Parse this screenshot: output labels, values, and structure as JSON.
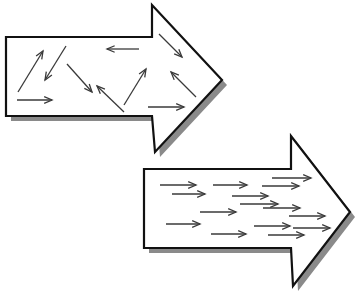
{
  "figure": {
    "width": 360,
    "height": 300,
    "background_color": "#ffffff",
    "outline_color": "#111111",
    "shadow_color": "#8a8a8a",
    "interior_arrow_color": "#3a3a3a",
    "outline_width": 2.2,
    "interior_arrow_width": 1.3
  },
  "shapes": [
    {
      "name": "disordered-arrow",
      "label": "upper-left block arrow with randomly oriented interior arrows",
      "direction": "right",
      "fill": "#ffffff",
      "outline_points": "6,37 152,37 152,5 222,80 155,152 152,116 6,116",
      "shadow_offset_x": 5,
      "shadow_offset_y": 5,
      "interior_arrows": [
        {
          "name": "arrow-up-right-1",
          "x1": 18,
          "y1": 92,
          "x2": 43,
          "y2": 51,
          "angle_deg": -58
        },
        {
          "name": "arrow-down-left-1",
          "x1": 66,
          "y1": 46,
          "x2": 45,
          "y2": 80,
          "angle_deg": 122
        },
        {
          "name": "arrow-right-1",
          "x1": 17,
          "y1": 100,
          "x2": 52,
          "y2": 100,
          "angle_deg": 0
        },
        {
          "name": "arrow-down-right-1",
          "x1": 67,
          "y1": 64,
          "x2": 92,
          "y2": 92,
          "angle_deg": 48
        },
        {
          "name": "arrow-left-1",
          "x1": 139,
          "y1": 49,
          "x2": 107,
          "y2": 49,
          "angle_deg": 180
        },
        {
          "name": "arrow-up-left-1",
          "x1": 124,
          "y1": 112,
          "x2": 97,
          "y2": 86,
          "angle_deg": -136
        },
        {
          "name": "arrow-up-right-2",
          "x1": 124,
          "y1": 105,
          "x2": 146,
          "y2": 69,
          "angle_deg": -59
        },
        {
          "name": "arrow-down-right-2",
          "x1": 159,
          "y1": 34,
          "x2": 182,
          "y2": 57,
          "angle_deg": 45
        },
        {
          "name": "arrow-up-left-2",
          "x1": 196,
          "y1": 97,
          "x2": 171,
          "y2": 72,
          "angle_deg": -135
        },
        {
          "name": "arrow-right-2",
          "x1": 148,
          "y1": 107,
          "x2": 184,
          "y2": 107,
          "angle_deg": 0
        }
      ]
    },
    {
      "name": "ordered-arrow",
      "label": "lower-right block arrow with aligned rightward interior arrows",
      "direction": "right",
      "fill": "#ffffff",
      "outline_points": "144,169 291,169 291,136 350,212 293,286 291,248 144,248",
      "shadow_offset_x": 5,
      "shadow_offset_y": 5,
      "interior_arrows": [
        {
          "name": "arrow-right-r1-1",
          "x1": 160,
          "y1": 185,
          "x2": 196,
          "y2": 185,
          "angle_deg": 0
        },
        {
          "name": "arrow-right-r1-2",
          "x1": 213,
          "y1": 185,
          "x2": 247,
          "y2": 185,
          "angle_deg": 0
        },
        {
          "name": "arrow-right-r1-3",
          "x1": 262,
          "y1": 186,
          "x2": 299,
          "y2": 186,
          "angle_deg": 0
        },
        {
          "name": "arrow-right-r1-4",
          "x1": 272,
          "y1": 178,
          "x2": 311,
          "y2": 178,
          "angle_deg": 0
        },
        {
          "name": "arrow-right-r2-1",
          "x1": 172,
          "y1": 194,
          "x2": 205,
          "y2": 194,
          "angle_deg": 0
        },
        {
          "name": "arrow-right-r2-2",
          "x1": 232,
          "y1": 196,
          "x2": 268,
          "y2": 196,
          "angle_deg": 0
        },
        {
          "name": "arrow-right-r2-3",
          "x1": 240,
          "y1": 204,
          "x2": 278,
          "y2": 204,
          "angle_deg": 0
        },
        {
          "name": "arrow-right-r2-4",
          "x1": 263,
          "y1": 208,
          "x2": 300,
          "y2": 208,
          "angle_deg": 0
        },
        {
          "name": "arrow-right-r3-1",
          "x1": 200,
          "y1": 212,
          "x2": 236,
          "y2": 212,
          "angle_deg": 0
        },
        {
          "name": "arrow-right-r3-2",
          "x1": 289,
          "y1": 216,
          "x2": 325,
          "y2": 216,
          "angle_deg": 0
        },
        {
          "name": "arrow-right-r4-1",
          "x1": 166,
          "y1": 224,
          "x2": 200,
          "y2": 224,
          "angle_deg": 0
        },
        {
          "name": "arrow-right-r4-2",
          "x1": 254,
          "y1": 226,
          "x2": 290,
          "y2": 226,
          "angle_deg": 0
        },
        {
          "name": "arrow-right-r4-3",
          "x1": 293,
          "y1": 228,
          "x2": 330,
          "y2": 228,
          "angle_deg": 0
        },
        {
          "name": "arrow-right-r5-1",
          "x1": 211,
          "y1": 234,
          "x2": 246,
          "y2": 234,
          "angle_deg": 0
        },
        {
          "name": "arrow-right-r5-2",
          "x1": 268,
          "y1": 235,
          "x2": 304,
          "y2": 235,
          "angle_deg": 0
        }
      ]
    }
  ]
}
